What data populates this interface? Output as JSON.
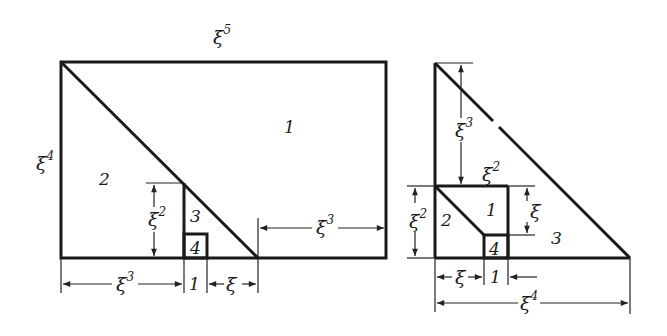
{
  "figure": {
    "left_diagram": {
      "top_label": {
        "base": "ξ",
        "exp": "5"
      },
      "left_label": {
        "base": "ξ",
        "exp": "4"
      },
      "region_labels": [
        "1",
        "2",
        "3",
        "4"
      ],
      "dim_height_inner": {
        "base": "ξ",
        "exp": "2"
      },
      "dim_right_gap": {
        "base": "ξ",
        "exp": "3"
      },
      "dim_bottom_left": {
        "base": "ξ",
        "exp": "3"
      },
      "dim_bottom_unit": "1",
      "dim_bottom_xi": "ξ"
    },
    "right_diagram": {
      "dim_top_height": {
        "base": "ξ",
        "exp": "3"
      },
      "dim_inner_top": {
        "base": "ξ",
        "exp": "2"
      },
      "dim_left_height": {
        "base": "ξ",
        "exp": "2"
      },
      "dim_inner_xi": "ξ",
      "region_labels": [
        "1",
        "2",
        "3",
        "4"
      ],
      "dim_bottom_xi": "ξ",
      "dim_bottom_unit": "1",
      "dim_bottom_total": {
        "base": "ξ",
        "exp": "4"
      }
    }
  }
}
